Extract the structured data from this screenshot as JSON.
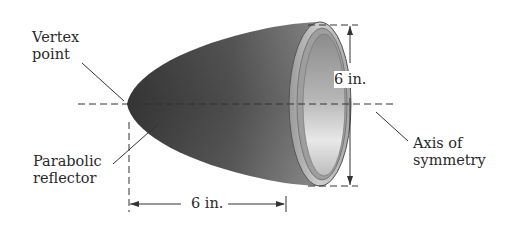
{
  "diagram": {
    "title": "Parabolic reflector",
    "labels": {
      "vertex_line1": "Vertex",
      "vertex_line2": "point",
      "reflector_line1": "Parabolic",
      "reflector_line2": "reflector",
      "axis_line1": "Axis of",
      "axis_line2": "symmetry",
      "height_dimension": "6 in.",
      "depth_dimension": "6 in."
    },
    "dimensions": {
      "diameter": "6 in.",
      "depth": "6 in."
    },
    "colors": {
      "body_dark": "#3a3a3a",
      "body_mid": "#7a7a7a",
      "rim": "#bdbdbd",
      "interior_light": "#e6e6e6",
      "line": "#333333"
    }
  }
}
